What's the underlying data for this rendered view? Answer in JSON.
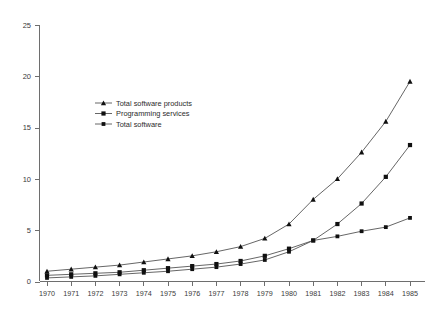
{
  "chart_data": {
    "type": "line",
    "title": "",
    "subtitle": "",
    "xlabel": "",
    "ylabel": "",
    "x": [
      1970,
      1971,
      1972,
      1973,
      1974,
      1975,
      1976,
      1977,
      1978,
      1979,
      1980,
      1981,
      1982,
      1983,
      1984,
      1985
    ],
    "categories": [
      "1970",
      "1971",
      "1972",
      "1973",
      "1974",
      "1975",
      "1976",
      "1977",
      "1978",
      "1979",
      "1980",
      "1981",
      "1982",
      "1983",
      "1984",
      "1985"
    ],
    "xlim": [
      1970,
      1985
    ],
    "ylim": [
      0,
      25
    ],
    "yticks": [
      0,
      5,
      10,
      15,
      20,
      25
    ],
    "ytick_labels": [
      "0",
      "5",
      "10",
      "15",
      "20",
      "25"
    ],
    "grid": false,
    "legend_position": "upper-left-inset",
    "series": [
      {
        "name": "Total software products",
        "marker": "triangle",
        "values": [
          1.0,
          1.2,
          1.4,
          1.6,
          1.9,
          2.2,
          2.5,
          2.9,
          3.4,
          4.2,
          5.6,
          8.0,
          10.0,
          12.6,
          15.6,
          19.5
        ]
      },
      {
        "name": "Programming services",
        "marker": "square",
        "values": [
          0.6,
          0.7,
          0.8,
          0.9,
          1.1,
          1.3,
          1.5,
          1.7,
          2.0,
          2.5,
          3.2,
          4.0,
          5.6,
          7.6,
          10.2,
          13.3
        ]
      },
      {
        "name": "Total software",
        "marker": "square-small",
        "values": [
          0.35,
          0.45,
          0.55,
          0.7,
          0.85,
          1.0,
          1.2,
          1.4,
          1.7,
          2.1,
          2.9,
          4.0,
          4.4,
          4.9,
          5.3,
          6.2
        ]
      }
    ]
  },
  "colors": {
    "axis": "#6e6e6e",
    "line": "#555555",
    "marker": "#101010",
    "text": "#3a3a3a",
    "background": "#ffffff"
  },
  "legend": {
    "entries": [
      {
        "label": "Total software products"
      },
      {
        "label": "Programming services"
      },
      {
        "label": "Total software"
      }
    ]
  }
}
